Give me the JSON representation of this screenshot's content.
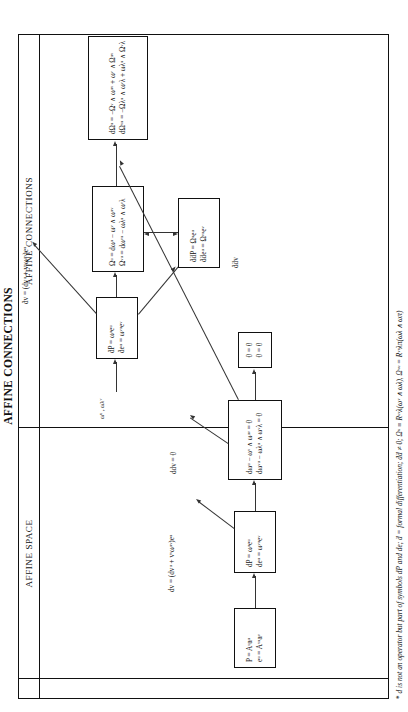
{
  "document": {
    "running_head": "AFFINE CONNECTIONS"
  },
  "columns": [
    {
      "id": "affine-space",
      "caption": "AFFINE SPACE"
    },
    {
      "id": "affine-connections",
      "caption": "AFFINE CONNECTIONS"
    }
  ],
  "boxes": [
    {
      "id": "point-frame",
      "lines": [
        "P = Aᵘaᵘ",
        "eᵘ = Aᵛᵘaᵛ"
      ]
    },
    {
      "id": "structure-space",
      "lines": [
        "dP = ωᵘeᵘ",
        "deᵘ = ωᵛᵘeᵛ"
      ]
    },
    {
      "id": "maurer-cartan",
      "lines": [
        "dωᵘ − ωᵛ ∧ ωᵘᵛ = 0",
        "dωᵛᵘ − ωλᵘ ∧ ωᵛλ = 0"
      ]
    },
    {
      "id": "zero-identities",
      "lines": [
        "0 = 0",
        "0 = 0"
      ]
    },
    {
      "id": "structure-connection",
      "lines": [
        "ḋP = ωᵘeᵘ",
        "ḋeᵘ = ωᵛᵘeᵛ"
      ]
    },
    {
      "id": "curvature-forms",
      "lines": [
        "Ωᵘ = dωᵘ − ωᵛ ∧ ωᵘᵛ",
        "Ωᵛᵘ = dωᵛᵘ − ωλᵘ ∧ ωᵛλ"
      ]
    },
    {
      "id": "second-differential",
      "lines": [
        "ḋḋP = Ωᵘeᵘ",
        "ḋḋeᵘ = Ωᵛᵘeᵛ"
      ]
    },
    {
      "id": "bianchi-identities",
      "lines": [
        "dΩᵘ = −Ωᵛ ∧ ωᵘᵛ + ωᵛ ∧ Ωᵘᵛ",
        "dΩᵛᵘ = −Ωλᵘ ∧ ωᵛλ + ωλᵘ ∧ Ωᵛλ"
      ]
    }
  ],
  "labels": [
    {
      "id": "dv-space",
      "text": "dv = (dvᵘ + vᵛωᵘᵛ)eᵘ"
    },
    {
      "id": "ddv-zero",
      "text": "ddv = 0"
    },
    {
      "id": "omega-inputs",
      "text": "ωᵘ , ωλᵛ"
    },
    {
      "id": "dv-connection",
      "text": "ḋv = (dvᵘ + vᵛωᵘᵛ)eᵘ"
    },
    {
      "id": "ddv-connection",
      "text": "ḋḋv"
    }
  ],
  "footnote": {
    "marker": "*",
    "text": "d is not an operator but part of symbols dP and de; ḋ = formal differentiation; ḋḋ ≠ 0; Ωᵘ ≡ Rᵘᵛλ(ωᵛ ∧ ωλ), Ωᵛᵘ = Rᵛᵘλπ(ωλ ∧ ωπ)"
  }
}
